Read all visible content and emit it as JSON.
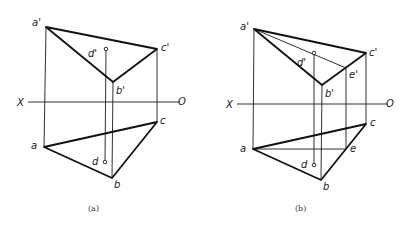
{
  "figure": {
    "panels": [
      {
        "id": "a",
        "caption": "(a)",
        "axis": {
          "x_label": "X",
          "o_label": "O"
        },
        "labels": {
          "a_prime": "a'",
          "b_prime": "b'",
          "c_prime": "c'",
          "d_prime": "d'",
          "a": "a",
          "b": "b",
          "c": "c",
          "d": "d"
        }
      },
      {
        "id": "b",
        "caption": "(b)",
        "axis": {
          "x_label": "X",
          "o_label": "O"
        },
        "labels": {
          "a_prime": "a'",
          "b_prime": "b'",
          "c_prime": "c'",
          "d_prime": "d'",
          "e_prime": "e'",
          "a": "a",
          "b": "b",
          "c": "c",
          "d": "d",
          "e": "e"
        }
      }
    ]
  }
}
